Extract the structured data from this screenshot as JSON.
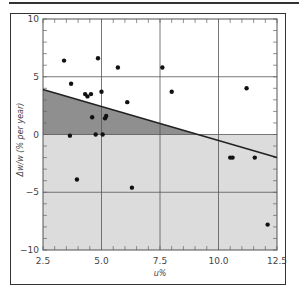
{
  "chart_data": {
    "type": "scatter",
    "title": "",
    "xlabel": "u%",
    "ylabel": "Δw/w (% per year)",
    "xlim": [
      2.5,
      12.5
    ],
    "ylim": [
      -10,
      10
    ],
    "x_ticks": [
      "2.5",
      "5.0",
      "7.5",
      "10.0",
      "12.5"
    ],
    "y_ticks": [
      "10",
      "5",
      "0",
      "-5",
      "-10"
    ],
    "grid": true,
    "points": [
      {
        "x": 3.4,
        "y": 6.4
      },
      {
        "x": 4.85,
        "y": 6.6
      },
      {
        "x": 3.7,
        "y": 4.4
      },
      {
        "x": 4.3,
        "y": 3.5
      },
      {
        "x": 4.4,
        "y": 3.3
      },
      {
        "x": 4.55,
        "y": 3.5
      },
      {
        "x": 5.0,
        "y": 3.7
      },
      {
        "x": 5.7,
        "y": 5.8
      },
      {
        "x": 7.6,
        "y": 5.8
      },
      {
        "x": 8.0,
        "y": 3.7
      },
      {
        "x": 6.1,
        "y": 2.8
      },
      {
        "x": 4.6,
        "y": 1.5
      },
      {
        "x": 5.15,
        "y": 1.4
      },
      {
        "x": 5.2,
        "y": 1.6
      },
      {
        "x": 3.65,
        "y": -0.1
      },
      {
        "x": 4.75,
        "y": 0.0
      },
      {
        "x": 5.05,
        "y": 0.0
      },
      {
        "x": 3.95,
        "y": -3.9
      },
      {
        "x": 6.3,
        "y": -4.6
      },
      {
        "x": 11.2,
        "y": 4.0
      },
      {
        "x": 10.5,
        "y": -2.0
      },
      {
        "x": 10.6,
        "y": -2.0
      },
      {
        "x": 11.55,
        "y": -2.0
      },
      {
        "x": 12.1,
        "y": -7.8
      }
    ],
    "trend_line": {
      "x": [
        2.5,
        12.5
      ],
      "y": [
        3.9,
        -2.0
      ]
    },
    "shaded_regions": [
      {
        "name": "below-trend-above-zero",
        "color": "#8f8f8f"
      },
      {
        "name": "below-zero",
        "color": "#dcdcdc"
      }
    ]
  }
}
